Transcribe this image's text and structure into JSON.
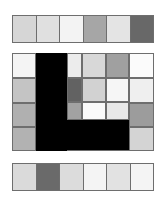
{
  "top_strip": {
    "cells": [
      {
        "color": "#d6d6d6"
      },
      {
        "color": "#e0e0e0"
      },
      {
        "color": "#f3f3f3"
      },
      {
        "color": "#a6a6a6"
      },
      {
        "color": "#e4e4e4"
      },
      {
        "color": "#686868"
      }
    ]
  },
  "board": {
    "tiles": [
      {
        "x": 0,
        "y": 0,
        "w": 24,
        "h": 25,
        "color": "#f4f4f4"
      },
      {
        "x": 24,
        "y": 0,
        "w": 31,
        "h": 98,
        "color": "#000000"
      },
      {
        "x": 55,
        "y": 0,
        "w": 15,
        "h": 25,
        "color": "#ececec"
      },
      {
        "x": 70,
        "y": 0,
        "w": 24,
        "h": 25,
        "color": "#d8d8d8"
      },
      {
        "x": 94,
        "y": 0,
        "w": 23,
        "h": 25,
        "color": "#a0a0a0"
      },
      {
        "x": 117,
        "y": 0,
        "w": 25,
        "h": 25,
        "color": "#fbfbfb"
      },
      {
        "x": 0,
        "y": 25,
        "w": 24,
        "h": 25,
        "color": "#c4c4c4"
      },
      {
        "x": 55,
        "y": 25,
        "w": 15,
        "h": 24,
        "color": "#626262"
      },
      {
        "x": 70,
        "y": 25,
        "w": 24,
        "h": 24,
        "color": "#d2d2d2"
      },
      {
        "x": 94,
        "y": 25,
        "w": 23,
        "h": 24,
        "color": "#f6f6f6"
      },
      {
        "x": 117,
        "y": 25,
        "w": 25,
        "h": 25,
        "color": "#efefef"
      },
      {
        "x": 0,
        "y": 50,
        "w": 24,
        "h": 24,
        "color": "#b0b0b0"
      },
      {
        "x": 55,
        "y": 49,
        "w": 15,
        "h": 18,
        "color": "#a2a2a2"
      },
      {
        "x": 70,
        "y": 49,
        "w": 24,
        "h": 18,
        "color": "#fafafa"
      },
      {
        "x": 94,
        "y": 49,
        "w": 23,
        "h": 18,
        "color": "#e8e8e8"
      },
      {
        "x": 117,
        "y": 50,
        "w": 25,
        "h": 24,
        "color": "#9c9c9c"
      },
      {
        "x": 0,
        "y": 74,
        "w": 24,
        "h": 24,
        "color": "#b2b2b2"
      },
      {
        "x": 117,
        "y": 74,
        "w": 25,
        "h": 24,
        "color": "#d4d4d4"
      }
    ]
  },
  "bottom_strip": {
    "cells": [
      {
        "color": "#dadada"
      },
      {
        "color": "#6a6a6a"
      },
      {
        "color": "#dcdcdc"
      },
      {
        "color": "#f4f4f4"
      },
      {
        "color": "#e2e2e2"
      },
      {
        "color": "#f4f4f4"
      }
    ]
  }
}
